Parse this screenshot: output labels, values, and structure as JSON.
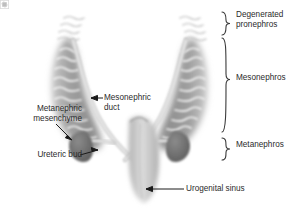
{
  "figure": {
    "background_color": "#ffffff",
    "width": 298,
    "height": 218
  },
  "colors": {
    "mesonephros_fill": "#9a9a9a",
    "mesonephros_edge": "#c8c8c8",
    "pronephros_fill": "#d9d9d9",
    "tubule_stroke": "#ffffff",
    "duct_stroke": "#e8e8e8",
    "duct_outline": "#b0b0b0",
    "metanephric_mesenchyme_fill": "#6f6f6f",
    "urogenital_sinus_fill": "#c4c4c4",
    "urogenital_sinus_edge": "#a8a8a8",
    "label_text": "#2b2b2b",
    "leader_line": "#1a1a1a",
    "brace_stroke": "#3a3a3a"
  },
  "brace_labels": [
    {
      "id": "degenerated-pronephros",
      "text": "Degenerated\npronephros",
      "span_top": 12,
      "span_bottom": 36
    },
    {
      "id": "mesonephros",
      "text": "Mesonephros",
      "span_top": 38,
      "span_bottom": 134
    },
    {
      "id": "metanephros",
      "text": "Metanephros",
      "span_top": 138,
      "span_bottom": 170
    }
  ],
  "callout_labels": [
    {
      "id": "mesonephric-duct",
      "text": "Mesonephric\nduct",
      "align": "left",
      "points_to": "mesonephric duct"
    },
    {
      "id": "metanephric-mesenchyme",
      "text": "Metanephric\nmesenchyme",
      "align": "right",
      "points_to": "metanephric mesenchyme"
    },
    {
      "id": "ureteric-bud",
      "text": "Ureteric bud",
      "align": "right",
      "points_to": "ureteric bud"
    },
    {
      "id": "urogenital-sinus",
      "text": "Urogenital sinus",
      "align": "left",
      "points_to": "urogenital sinus"
    }
  ],
  "structures": [
    {
      "name": "degenerated-pronephros",
      "side": "both",
      "description": "faint wavy remnant tubules at top"
    },
    {
      "name": "mesonephros",
      "side": "both",
      "description": "large gray wedge with white tubules"
    },
    {
      "name": "mesonephric-duct",
      "side": "both",
      "description": "pale duct running along medial edge of mesonephros"
    },
    {
      "name": "metanephric-mesenchyme",
      "side": "both",
      "description": "dark gray oval cap"
    },
    {
      "name": "ureteric-bud",
      "side": "both",
      "description": "short branch from duct into mesenchyme"
    },
    {
      "name": "urogenital-sinus",
      "side": "midline",
      "description": "central pale elongated sac"
    }
  ],
  "watermark": {
    "icon": "image-placeholder-icon"
  }
}
